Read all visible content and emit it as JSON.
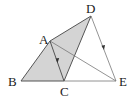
{
  "diagram": {
    "points": {
      "A": {
        "label": "A",
        "x": 50,
        "y": 41
      },
      "B": {
        "label": "B",
        "x": 21,
        "y": 81
      },
      "C": {
        "label": "C",
        "x": 64,
        "y": 81
      },
      "D": {
        "label": "D",
        "x": 91,
        "y": 16
      },
      "E": {
        "label": "E",
        "x": 116,
        "y": 81
      }
    },
    "shaded_regions": [
      "ABC",
      "ADC"
    ],
    "segments": [
      "AB",
      "BC",
      "CE",
      "AD",
      "DC",
      "DE",
      "AE",
      "AC"
    ],
    "arrows": [
      "A->C",
      "D->E"
    ],
    "colors": {
      "shade": "#d4d4d4",
      "stroke": "#555555",
      "thin_stroke": "#777777"
    }
  }
}
